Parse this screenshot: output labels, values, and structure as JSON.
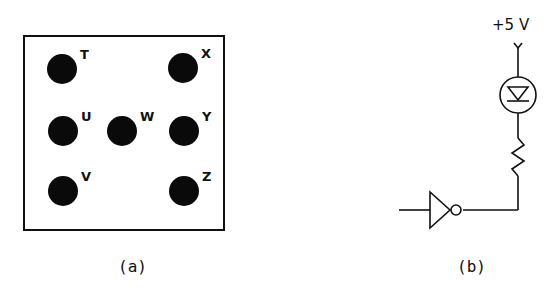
{
  "panel_a": {
    "caption": "(a)",
    "dots": [
      {
        "label": "T",
        "cx": 62,
        "cy": 69
      },
      {
        "label": "X",
        "cx": 183,
        "cy": 68
      },
      {
        "label": "U",
        "cx": 63,
        "cy": 131
      },
      {
        "label": "W",
        "cx": 122,
        "cy": 131
      },
      {
        "label": "Y",
        "cx": 184,
        "cy": 131
      },
      {
        "label": "V",
        "cx": 63,
        "cy": 191
      },
      {
        "label": "Z",
        "cx": 184,
        "cy": 191
      }
    ]
  },
  "panel_b": {
    "caption": "(b)",
    "supply_label": "+5 V",
    "components": [
      "supply-terminal",
      "led",
      "resistor",
      "inverter"
    ]
  }
}
